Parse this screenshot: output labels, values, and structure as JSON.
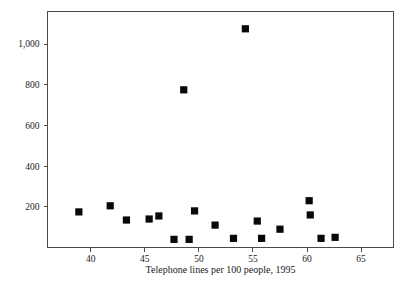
{
  "chart_data": {
    "type": "scatter",
    "title": "",
    "xlabel": "Telephone lines per 100 people, 1995",
    "ylabel": "",
    "xlim": [
      36.0,
      68.0
    ],
    "ylim": [
      0,
      1160
    ],
    "grid": false,
    "legend": null,
    "xticks": [
      40,
      45,
      50,
      55,
      60,
      65
    ],
    "xtick_labels": [
      "40",
      "45",
      "50",
      "55",
      "60",
      "65"
    ],
    "yticks": [
      200,
      400,
      600,
      800,
      1000
    ],
    "ytick_labels": [
      "200",
      "400",
      "600",
      "800",
      "1,000"
    ],
    "marker": "square",
    "marker_color": "#080808",
    "series": [
      {
        "name": "countries",
        "points": [
          {
            "x": 38.9,
            "y": 175
          },
          {
            "x": 41.8,
            "y": 205
          },
          {
            "x": 43.3,
            "y": 135
          },
          {
            "x": 45.4,
            "y": 140
          },
          {
            "x": 46.3,
            "y": 155
          },
          {
            "x": 47.7,
            "y": 40
          },
          {
            "x": 48.6,
            "y": 775
          },
          {
            "x": 49.1,
            "y": 40
          },
          {
            "x": 49.6,
            "y": 180
          },
          {
            "x": 51.5,
            "y": 110
          },
          {
            "x": 53.2,
            "y": 45
          },
          {
            "x": 54.3,
            "y": 1075
          },
          {
            "x": 55.4,
            "y": 130
          },
          {
            "x": 55.8,
            "y": 45
          },
          {
            "x": 57.5,
            "y": 90
          },
          {
            "x": 60.2,
            "y": 230
          },
          {
            "x": 60.3,
            "y": 160
          },
          {
            "x": 61.3,
            "y": 45
          },
          {
            "x": 62.6,
            "y": 50
          }
        ]
      }
    ]
  },
  "axis_labels": {
    "x_axis_title": "Telephone lines per 100 people, 1995"
  }
}
